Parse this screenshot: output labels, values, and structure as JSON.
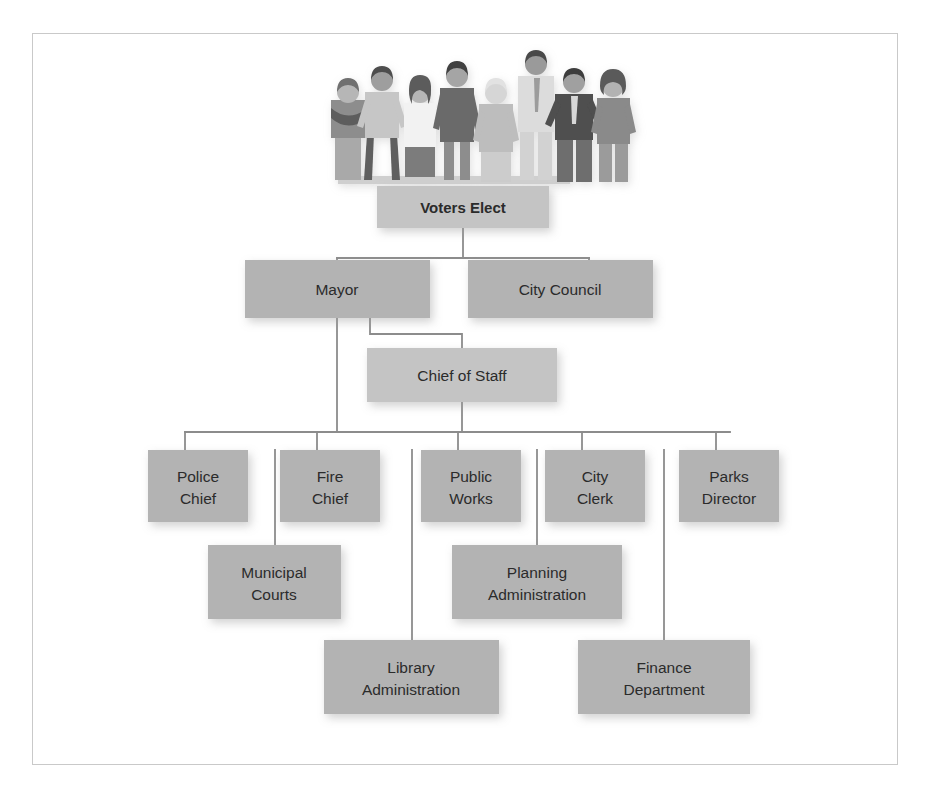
{
  "diagram": {
    "type": "org-chart",
    "frame": {
      "border_color": "#c9c9c9",
      "background": "#ffffff"
    },
    "style": {
      "box_fill": "#b3b3b3",
      "box_fill_light": "#c4c4c4",
      "connector_color": "#8c8c8c",
      "text_color": "#2b2b2b",
      "shadow_color": "#d9d9d9"
    },
    "illustration": {
      "name": "group-of-voters-illustration",
      "description": "Illustration of nine standing people representing the electorate",
      "people_count": 9
    },
    "nodes": [
      {
        "id": "voters",
        "label": "Voters Elect",
        "line1": "Voters Elect",
        "line2": "",
        "bold": true,
        "x": 377,
        "y": 186,
        "w": 172,
        "h": 42,
        "fill": "#c4c4c4"
      },
      {
        "id": "mayor",
        "label": "Mayor",
        "line1": "Mayor",
        "line2": "",
        "bold": false,
        "x": 245,
        "y": 260,
        "w": 185,
        "h": 58,
        "fill": "#b3b3b3"
      },
      {
        "id": "council",
        "label": "City Council",
        "line1": "City Council",
        "line2": "",
        "bold": false,
        "x": 468,
        "y": 260,
        "w": 185,
        "h": 58,
        "fill": "#b3b3b3"
      },
      {
        "id": "chief",
        "label": "Chief of Staff",
        "line1": "Chief of Staff",
        "line2": "",
        "bold": false,
        "x": 367,
        "y": 348,
        "w": 190,
        "h": 54,
        "fill": "#c4c4c4"
      },
      {
        "id": "police",
        "label": "Police Chief",
        "line1": "Police",
        "line2": "Chief",
        "bold": false,
        "x": 148,
        "y": 450,
        "w": 100,
        "h": 72,
        "fill": "#b3b3b3"
      },
      {
        "id": "fire",
        "label": "Fire Chief",
        "line1": "Fire",
        "line2": "Chief",
        "bold": false,
        "x": 280,
        "y": 450,
        "w": 100,
        "h": 72,
        "fill": "#b3b3b3"
      },
      {
        "id": "works",
        "label": "Public Works",
        "line1": "Public",
        "line2": "Works",
        "bold": false,
        "x": 421,
        "y": 450,
        "w": 100,
        "h": 72,
        "fill": "#b3b3b3"
      },
      {
        "id": "clerk",
        "label": "City Clerk",
        "line1": "City",
        "line2": "Clerk",
        "bold": false,
        "x": 545,
        "y": 450,
        "w": 100,
        "h": 72,
        "fill": "#b3b3b3"
      },
      {
        "id": "parks",
        "label": "Parks Director",
        "line1": "Parks",
        "line2": "Director",
        "bold": false,
        "x": 679,
        "y": 450,
        "w": 100,
        "h": 72,
        "fill": "#b3b3b3"
      },
      {
        "id": "courts",
        "label": "Municipal Courts",
        "line1": "Municipal",
        "line2": "Courts",
        "bold": false,
        "x": 208,
        "y": 545,
        "w": 133,
        "h": 74,
        "fill": "#b3b3b3"
      },
      {
        "id": "planning",
        "label": "Planning Administration",
        "line1": "Planning",
        "line2": "Administration",
        "bold": false,
        "x": 452,
        "y": 545,
        "w": 170,
        "h": 74,
        "fill": "#b3b3b3"
      },
      {
        "id": "library",
        "label": "Library Administration",
        "line1": "Library",
        "line2": "Administration",
        "bold": false,
        "x": 324,
        "y": 640,
        "w": 175,
        "h": 74,
        "fill": "#b3b3b3"
      },
      {
        "id": "finance",
        "label": "Finance Department",
        "line1": "Finance",
        "line2": "Department",
        "bold": false,
        "x": 578,
        "y": 640,
        "w": 172,
        "h": 74,
        "fill": "#b3b3b3"
      }
    ],
    "edges": [
      {
        "from": "voters",
        "to": "mayor",
        "name": "edge-voters-to-mayor"
      },
      {
        "from": "voters",
        "to": "council",
        "name": "edge-voters-to-city-council"
      },
      {
        "from": "mayor",
        "to": "chief",
        "name": "edge-mayor-to-chief-of-staff"
      },
      {
        "from": "mayor",
        "to": "police",
        "name": "edge-mayor-to-departments"
      },
      {
        "from": "chief",
        "to": "works",
        "name": "edge-chief-of-staff-to-departments"
      },
      {
        "from": "police",
        "to": "courts",
        "name": "edge-police-chief-to-municipal-courts"
      },
      {
        "from": "works",
        "to": "planning",
        "name": "edge-public-works-to-planning"
      },
      {
        "from": "works",
        "to": "library",
        "name": "edge-public-works-to-library"
      },
      {
        "from": "parks",
        "to": "finance",
        "name": "edge-parks-to-finance"
      }
    ]
  }
}
